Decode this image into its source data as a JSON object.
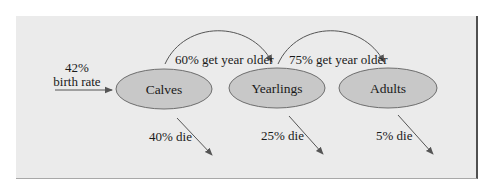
{
  "diagram": {
    "type": "population-flow",
    "colors": {
      "panel_bg": "#ebebeb",
      "node_fill": "#c8c8c8",
      "node_stroke": "#6e6e6e",
      "arrow": "#555555",
      "text": "#1a1a1a"
    },
    "input": {
      "value": "42%",
      "label": "birth rate"
    },
    "nodes": [
      {
        "id": "calves",
        "label": "Calves"
      },
      {
        "id": "yearlings",
        "label": "Yearlings"
      },
      {
        "id": "adults",
        "label": "Adults"
      }
    ],
    "transitions": [
      {
        "from": "calves",
        "to": "yearlings",
        "label": "60% get year older"
      },
      {
        "from": "yearlings",
        "to": "adults",
        "label": "75% get year older"
      }
    ],
    "deaths": [
      {
        "node": "calves",
        "label": "40% die"
      },
      {
        "node": "yearlings",
        "label": "25% die"
      },
      {
        "node": "adults",
        "label": "5% die"
      }
    ]
  }
}
